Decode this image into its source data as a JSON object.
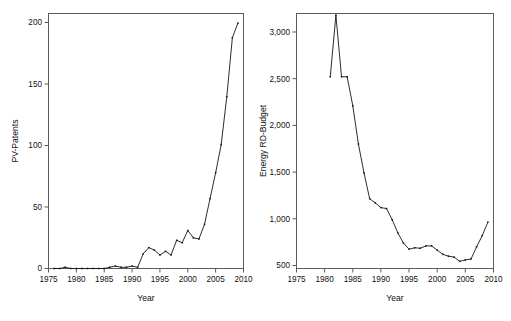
{
  "figure": {
    "background_color": "#ffffff",
    "line_color": "#141414",
    "frame_color": "#555c63",
    "panel_count": 2
  },
  "chart_data": [
    {
      "id": "pv-patents",
      "type": "line",
      "title": "",
      "xlabel": "Year",
      "ylabel": "PV-Patents",
      "xlim": [
        1975,
        2010
      ],
      "ylim": [
        0,
        205
      ],
      "xticks": [
        1975,
        1980,
        1985,
        1990,
        1995,
        2000,
        2005,
        2010
      ],
      "xticklabels": [
        "1975",
        "1980",
        "1985",
        "1990",
        "1995",
        "2000",
        "2005",
        "2010"
      ],
      "yticks": [
        0,
        50,
        100,
        150,
        200
      ],
      "yticklabels": [
        "0",
        "50",
        "100",
        "150",
        "200"
      ],
      "grid": false,
      "legend": "none",
      "markers": "small-dot",
      "x": [
        1976,
        1977,
        1978,
        1979,
        1980,
        1981,
        1982,
        1983,
        1984,
        1985,
        1986,
        1987,
        1988,
        1989,
        1990,
        1991,
        1992,
        1993,
        1994,
        1995,
        1996,
        1997,
        1998,
        1999,
        2000,
        2001,
        2002,
        2003,
        2004,
        2005,
        2006,
        2007,
        2008,
        2009
      ],
      "values": [
        0,
        0,
        1,
        0,
        0,
        0,
        0,
        0,
        0,
        0,
        1,
        2,
        1,
        1,
        2,
        1,
        12,
        17,
        15,
        11,
        14,
        11,
        23,
        21,
        31,
        25,
        24,
        36,
        57,
        78,
        101,
        140,
        188,
        200
      ]
    },
    {
      "id": "energy-rd-budget",
      "type": "line",
      "title": "",
      "xlabel": "Year",
      "ylabel": "Energy RD-Budget",
      "xlim": [
        1975,
        2010
      ],
      "ylim": [
        480,
        3250
      ],
      "xticks": [
        1975,
        1980,
        1985,
        1990,
        1995,
        2000,
        2005,
        2010
      ],
      "xticklabels": [
        "1975",
        "1980",
        "1985",
        "1990",
        "1995",
        "2000",
        "2005",
        "2010"
      ],
      "yticks": [
        500,
        1000,
        1500,
        2000,
        2500,
        3000
      ],
      "yticklabels": [
        "500",
        "1,000",
        "1,500",
        "2,000",
        "2,500",
        "3,000"
      ],
      "grid": false,
      "legend": "none",
      "markers": "small-dot",
      "x": [
        1981,
        1982,
        1983,
        1984,
        1985,
        1986,
        1987,
        1988,
        1989,
        1990,
        1991,
        1992,
        1993,
        1994,
        1995,
        1996,
        1997,
        1998,
        1999,
        2000,
        2001,
        2002,
        2003,
        2004,
        2005,
        2006,
        2007,
        2008,
        2009
      ],
      "values": [
        2520,
        3180,
        2520,
        2520,
        2210,
        1800,
        1490,
        1215,
        1170,
        1120,
        1110,
        990,
        850,
        740,
        675,
        690,
        685,
        710,
        710,
        665,
        620,
        600,
        590,
        545,
        560,
        570,
        700,
        820,
        965
      ]
    }
  ]
}
